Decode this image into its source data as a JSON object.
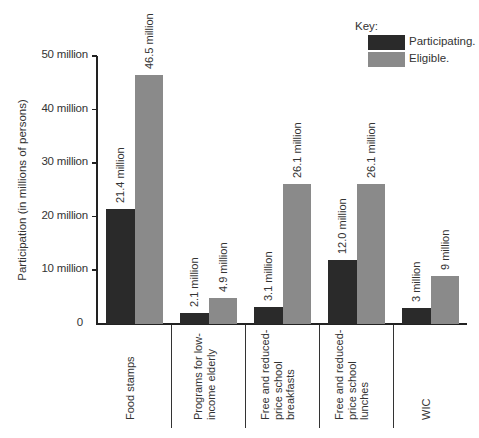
{
  "chart_data": {
    "type": "bar",
    "title": "",
    "xlabel": "",
    "ylabel": "Participation (in millions of persons)",
    "ylim": [
      0,
      50
    ],
    "yticks": [
      "0",
      "10 million",
      "20 million",
      "30 million",
      "40 million",
      "50 million"
    ],
    "grid": false,
    "legend_position": "top-right",
    "legend_title": "Key:",
    "categories": [
      "Food stamps",
      "Programs for low-income elderly",
      "Free and reduced-price school breakfasts",
      "Free and reduced-price school lunches",
      "WIC"
    ],
    "series": [
      {
        "name": "Participating.",
        "color": "#2a2a2a",
        "values": [
          21.4,
          2.1,
          3.1,
          12.0,
          3
        ],
        "labels": [
          "21.4 million",
          "2.1 million",
          "3.1 million",
          "12.0 million",
          "3 million"
        ]
      },
      {
        "name": "Eligible.",
        "color": "#8a8a8a",
        "values": [
          46.5,
          4.9,
          26.1,
          26.1,
          9
        ],
        "labels": [
          "46.5 million",
          "4.9 million",
          "26.1 million",
          "26.1 million",
          "9 million"
        ]
      }
    ]
  },
  "display": {
    "ylabel": "Participation  (in millions of persons)",
    "yticks": [
      "0",
      "10 million",
      "20 million",
      "30 million",
      "40 million",
      "50 million"
    ],
    "legend": {
      "title": "Key:",
      "items": [
        "Participating.",
        "Eligible."
      ]
    },
    "category_lines": [
      "Food stamps",
      "Programs for low-\nincome elderly",
      "Free and reduced-\nprice school\nbreakfasts",
      "Free and reduced-\nprice school\nlunches",
      "WIC"
    ],
    "bar_labels": {
      "participating": [
        "21.4 million",
        "2.1 million",
        "3.1 million",
        "12.0 million",
        "3 million"
      ],
      "eligible": [
        "46.5 million",
        "4.9 million",
        "26.1 million",
        "26.1 million",
        "9 million"
      ]
    }
  }
}
